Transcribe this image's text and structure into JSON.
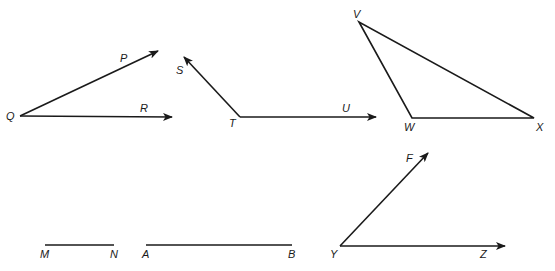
{
  "figures": [
    {
      "id": "angle-PQR",
      "type": "angle",
      "vertex": {
        "name": "Q",
        "x": 20,
        "y": 116,
        "label_x": 6,
        "label_y": 120
      },
      "rays": [
        {
          "name": "P",
          "x": 158,
          "y": 51,
          "label_x": 120,
          "label_y": 62,
          "arrow": true
        },
        {
          "name": "R",
          "x": 172,
          "y": 117,
          "label_x": 140,
          "label_y": 112,
          "arrow": true
        }
      ]
    },
    {
      "id": "angle-STU",
      "type": "angle",
      "vertex": {
        "name": "T",
        "x": 240,
        "y": 117,
        "label_x": 229,
        "label_y": 127
      },
      "rays": [
        {
          "name": "S",
          "x": 184,
          "y": 57,
          "label_x": 176,
          "label_y": 74,
          "arrow": true
        },
        {
          "name": "U",
          "x": 376,
          "y": 117,
          "label_x": 342,
          "label_y": 112,
          "arrow": true
        }
      ]
    },
    {
      "id": "triangle-VWX",
      "type": "triangle",
      "points": [
        {
          "name": "V",
          "x": 359,
          "y": 22,
          "label_x": 353,
          "label_y": 18
        },
        {
          "name": "W",
          "x": 412,
          "y": 118,
          "label_x": 404,
          "label_y": 131
        },
        {
          "name": "X",
          "x": 534,
          "y": 118,
          "label_x": 536,
          "label_y": 131
        }
      ]
    },
    {
      "id": "segment-MN",
      "type": "segment",
      "endpoints": [
        {
          "name": "M",
          "x": 45,
          "y": 245,
          "label_x": 40,
          "label_y": 258
        },
        {
          "name": "N",
          "x": 114,
          "y": 245,
          "label_x": 110,
          "label_y": 258
        }
      ]
    },
    {
      "id": "segment-AB",
      "type": "segment",
      "endpoints": [
        {
          "name": "A",
          "x": 146,
          "y": 245,
          "label_x": 142,
          "label_y": 258
        },
        {
          "name": "B",
          "x": 292,
          "y": 245,
          "label_x": 288,
          "label_y": 258
        }
      ]
    },
    {
      "id": "angle-FYZ",
      "type": "angle",
      "vertex": {
        "name": "Y",
        "x": 340,
        "y": 246,
        "label_x": 330,
        "label_y": 258
      },
      "rays": [
        {
          "name": "F",
          "x": 428,
          "y": 153,
          "label_x": 406,
          "label_y": 162,
          "arrow": true
        },
        {
          "name": "Z",
          "x": 505,
          "y": 246,
          "label_x": 480,
          "label_y": 258,
          "arrow": true
        }
      ]
    }
  ],
  "colors": {
    "stroke": "#1a1a1a",
    "background": "#ffffff"
  }
}
